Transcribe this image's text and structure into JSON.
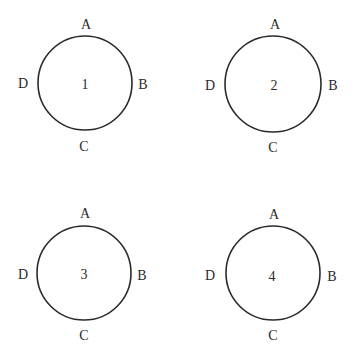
{
  "diagram": {
    "stroke_color": "#2a2a2a",
    "background": "#ffffff",
    "circles": [
      {
        "number": "1",
        "cx": 85,
        "cy": 83,
        "r": 47,
        "labels": {
          "top": "A",
          "right": "B",
          "bottom": "C",
          "left": "D"
        }
      },
      {
        "number": "2",
        "cx": 273,
        "cy": 84,
        "r": 48,
        "labels": {
          "top": "A",
          "right": "B",
          "bottom": "C",
          "left": "D"
        }
      },
      {
        "number": "3",
        "cx": 84,
        "cy": 273,
        "r": 47,
        "labels": {
          "top": "A",
          "right": "B",
          "bottom": "C",
          "left": "D"
        }
      },
      {
        "number": "4",
        "cx": 273,
        "cy": 273,
        "r": 47,
        "labels": {
          "top": "A",
          "right": "B",
          "bottom": "C",
          "left": "D"
        }
      }
    ]
  }
}
